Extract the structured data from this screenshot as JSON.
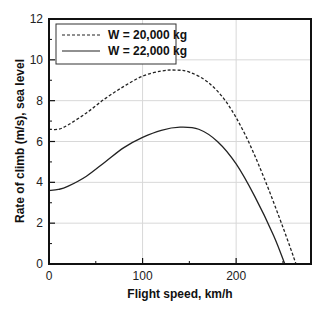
{
  "chart_data": {
    "type": "line",
    "title": "",
    "xlabel": "Flight speed, km/h",
    "ylabel": "Rate of climb (m/s), sea level",
    "xlim": [
      0,
      280
    ],
    "ylim": [
      0,
      12
    ],
    "xticks": [
      0,
      100,
      200
    ],
    "yticks": [
      0,
      2,
      4,
      6,
      8,
      10,
      12
    ],
    "grid": true,
    "legend_position": "upper left",
    "series": [
      {
        "name": "W = 20,000 kg",
        "style": "dashed",
        "color": "#222222",
        "x": [
          0,
          10,
          20,
          40,
          60,
          80,
          100,
          120,
          135,
          150,
          170,
          190,
          210,
          230,
          250,
          264
        ],
        "y": [
          6.6,
          6.6,
          6.8,
          7.4,
          8.1,
          8.7,
          9.2,
          9.45,
          9.5,
          9.4,
          8.9,
          7.9,
          6.3,
          4.2,
          1.8,
          0
        ]
      },
      {
        "name": "W = 22,000 kg",
        "style": "solid",
        "color": "#222222",
        "x": [
          0,
          10,
          20,
          40,
          60,
          80,
          100,
          120,
          140,
          160,
          180,
          200,
          220,
          240,
          252
        ],
        "y": [
          3.6,
          3.65,
          3.8,
          4.3,
          5.0,
          5.7,
          6.2,
          6.55,
          6.7,
          6.6,
          6.0,
          4.9,
          3.3,
          1.4,
          0
        ]
      }
    ]
  }
}
